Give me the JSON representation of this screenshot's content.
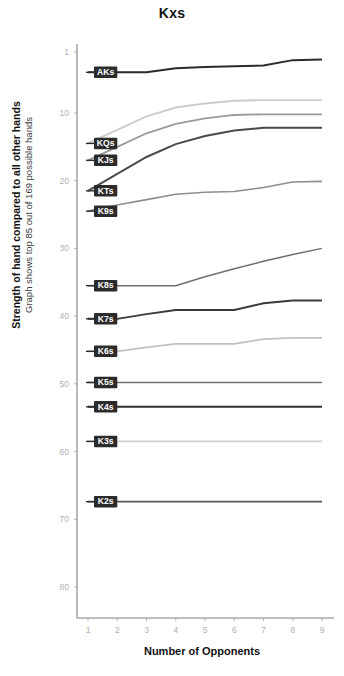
{
  "chart_data": {
    "type": "line",
    "title": "Kxs",
    "xlabel": "Number of Opponents",
    "ylabel": "Strength of hand compared to all other hands",
    "ylabel_sub": "Graph shows top 85 out of 169 possible hands",
    "x": [
      1,
      2,
      3,
      4,
      5,
      6,
      7,
      8,
      9
    ],
    "xticks": [
      "1",
      "2",
      "3",
      "4",
      "5",
      "6",
      "7",
      "8",
      "9"
    ],
    "yticks": [
      "1",
      "10",
      "20",
      "30",
      "40",
      "50",
      "60",
      "70",
      "80"
    ],
    "ytick_values": [
      1,
      10,
      20,
      30,
      40,
      50,
      60,
      70,
      80
    ],
    "xlim": [
      1,
      9
    ],
    "ylim": [
      1,
      85
    ],
    "y_inverted": true,
    "grid": false,
    "legend": "inline-labels-at-left",
    "series": [
      {
        "name": "AKs",
        "color": "#2b2b2b",
        "width": 2.0,
        "values": [
          4,
          4,
          4,
          3.4,
          3.2,
          3.1,
          3.0,
          2.2,
          2.1
        ]
      },
      {
        "name": "KQs",
        "color": "#cccccc",
        "width": 1.9,
        "values": [
          14.5,
          12.5,
          10.5,
          9.2,
          8.6,
          8.2,
          8.1,
          8.1,
          8.1
        ]
      },
      {
        "name": "KJs",
        "color": "#9a9a9a",
        "width": 1.8,
        "values": [
          17.0,
          15.0,
          13.0,
          11.6,
          10.8,
          10.3,
          10.2,
          10.2,
          10.2
        ]
      },
      {
        "name": "KTs",
        "color": "#4a4a4a",
        "width": 2.0,
        "values": [
          21.5,
          19.0,
          16.5,
          14.6,
          13.4,
          12.6,
          12.2,
          12.2,
          12.2
        ]
      },
      {
        "name": "K9s",
        "color": "#8e8e8e",
        "width": 1.6,
        "values": [
          24.5,
          23.6,
          22.8,
          22.0,
          21.7,
          21.6,
          21.0,
          20.2,
          20.1
        ]
      },
      {
        "name": "K8s",
        "color": "#6f6f6f",
        "width": 1.5,
        "values": [
          35.5,
          35.5,
          35.5,
          35.5,
          34.2,
          33.0,
          31.9,
          30.9,
          30.0
        ]
      },
      {
        "name": "K7s",
        "color": "#3a3a3a",
        "width": 1.9,
        "values": [
          40.4,
          40.4,
          39.7,
          39.1,
          39.1,
          39.1,
          38.1,
          37.7,
          37.7
        ]
      },
      {
        "name": "K6s",
        "color": "#c0c0c0",
        "width": 1.8,
        "values": [
          45.2,
          45.2,
          44.6,
          44.1,
          44.1,
          44.1,
          43.4,
          43.2,
          43.2
        ]
      },
      {
        "name": "K5s",
        "color": "#747474",
        "width": 1.6,
        "values": [
          49.8,
          49.8,
          49.8,
          49.8,
          49.8,
          49.8,
          49.8,
          49.8,
          49.8
        ]
      },
      {
        "name": "K4s",
        "color": "#2f2f2f",
        "width": 2.0,
        "values": [
          53.4,
          53.4,
          53.4,
          53.4,
          53.4,
          53.4,
          53.4,
          53.4,
          53.4
        ]
      },
      {
        "name": "K3s",
        "color": "#d2d2d2",
        "width": 1.9,
        "values": [
          58.5,
          58.5,
          58.5,
          58.5,
          58.5,
          58.5,
          58.5,
          58.5,
          58.5
        ]
      },
      {
        "name": "K2s",
        "color": "#5a5a5a",
        "width": 1.8,
        "values": [
          67.4,
          67.4,
          67.4,
          67.4,
          67.4,
          67.4,
          67.4,
          67.4,
          67.4
        ]
      }
    ]
  }
}
